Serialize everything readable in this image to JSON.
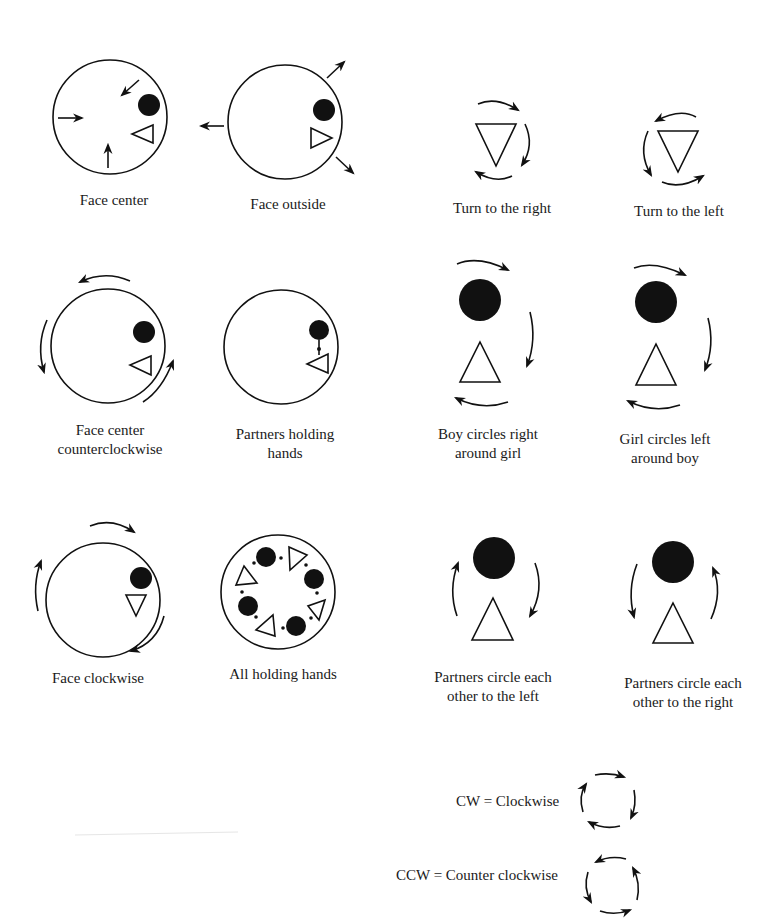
{
  "diagrams": {
    "face_center": {
      "label": "Face center"
    },
    "face_outside": {
      "label": "Face outside"
    },
    "turn_right": {
      "label": "Turn to the right"
    },
    "turn_left": {
      "label": "Turn to the left"
    },
    "face_center_ccw": {
      "label_line1": "Face center",
      "label_line2": "counterclockwise"
    },
    "partners_holding_hands": {
      "label_line1": "Partners holding",
      "label_line2": "hands"
    },
    "boy_circles_right": {
      "label_line1": "Boy circles right",
      "label_line2": "around girl"
    },
    "girl_circles_left": {
      "label_line1": "Girl circles left",
      "label_line2": "around boy"
    },
    "face_clockwise": {
      "label": "Face clockwise"
    },
    "all_holding_hands": {
      "label": "All holding hands"
    },
    "partners_circle_left": {
      "label_line1": "Partners circle each",
      "label_line2": "other to the left"
    },
    "partners_circle_right": {
      "label_line1": "Partners circle each",
      "label_line2": "other to the right"
    }
  },
  "legend": {
    "cw": {
      "label": "CW = Clockwise",
      "icon": "clockwise-arrows-icon"
    },
    "ccw": {
      "label": "CCW = Counter clockwise",
      "icon": "counterclockwise-arrows-icon"
    }
  },
  "symbols": {
    "boy": "filled-circle",
    "girl": "open-triangle"
  },
  "colors": {
    "ink": "#111111",
    "background": "#ffffff"
  }
}
